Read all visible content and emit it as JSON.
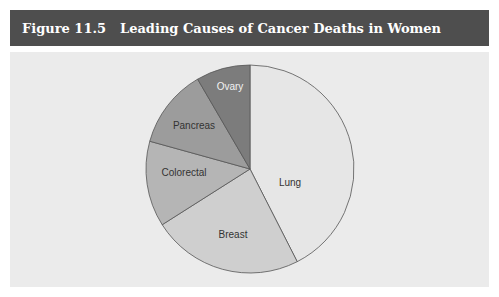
{
  "figure": {
    "number": "Figure 11.5",
    "title": "Leading Causes of Cancer Deaths in Women"
  },
  "chart_data": {
    "type": "pie",
    "title": "Leading Causes of Cancer Deaths in Women",
    "categories": [
      "Lung",
      "Breast",
      "Colorectal",
      "Pancreas",
      "Ovary"
    ],
    "values": [
      42.5,
      23.5,
      13.3,
      12.3,
      8.4
    ],
    "values_note": "approximate shares estimated from slice angles; no numeric labels shown",
    "start_angle": "12 o'clock, clockwise",
    "legend": "none (labels inside slices)",
    "colors": [
      "#e6e6e6",
      "#cfcfcf",
      "#b5b5b5",
      "#9c9c9c",
      "#7c7c7c"
    ],
    "label_colors": [
      "#333333",
      "#333333",
      "#333333",
      "#333333",
      "#f2f2f2"
    ]
  },
  "labels": {
    "lung": "Lung",
    "breast": "Breast",
    "colorectal": "Colorectal",
    "pancreas": "Pancreas",
    "ovary": "Ovary"
  }
}
